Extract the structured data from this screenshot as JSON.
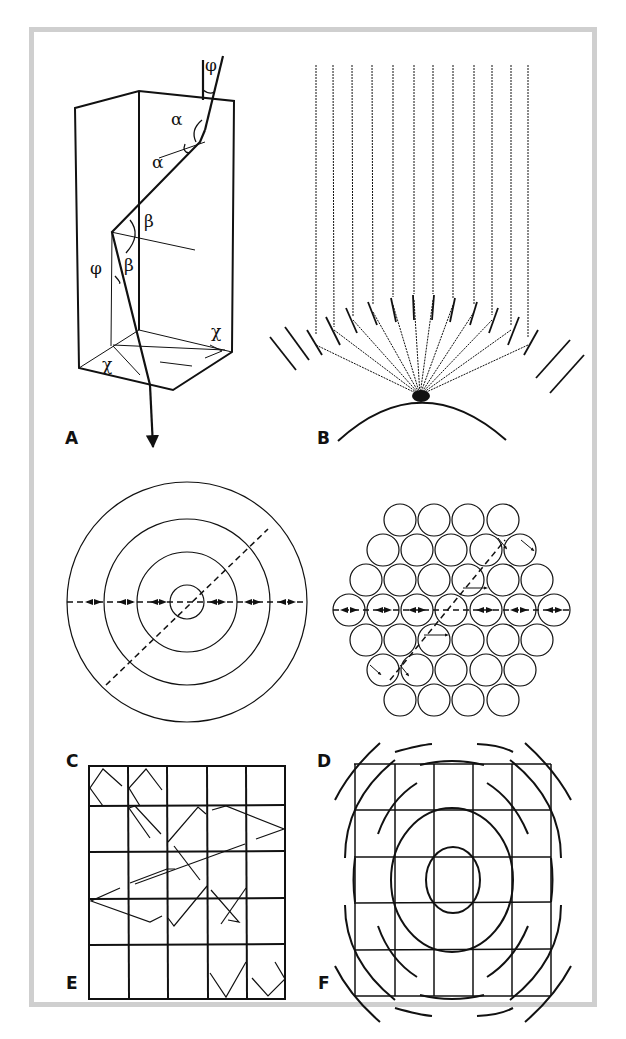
{
  "figure": {
    "frame_color": "#cfcfcf",
    "ink_color": "#111111",
    "panels": [
      {
        "id": "A",
        "label": "A",
        "description": "Light ray refracted through a rectangular prism/column, reflecting at the base",
        "angle_labels": [
          "φ",
          "α",
          "α",
          "β",
          "β",
          "φ",
          "χ",
          "χ"
        ]
      },
      {
        "id": "B",
        "label": "B",
        "description": "Parallel rays deflected by angled reflectors converging to a focus on a curved surface"
      },
      {
        "id": "C",
        "label": "C",
        "description": "Concentric rings with rays through the center along horizontal and diagonal directions"
      },
      {
        "id": "D",
        "label": "D",
        "description": "Hexagonally packed circles with ray paths along horizontal and diagonal rows"
      },
      {
        "id": "E",
        "label": "E",
        "description": "Square 5x5 grid with zigzag reflected ray paths"
      },
      {
        "id": "F",
        "label": "F",
        "description": "Square grid overlaid with concentric circular arcs"
      }
    ]
  }
}
